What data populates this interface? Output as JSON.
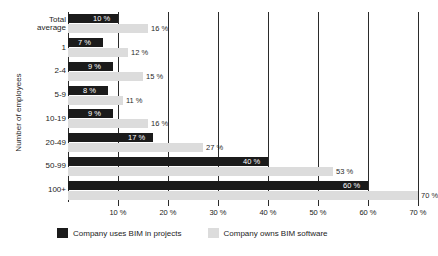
{
  "chart_data": {
    "type": "bar",
    "orientation": "horizontal",
    "title": "",
    "xlabel": "",
    "ylabel": "Number of employees",
    "xlim": [
      0,
      70
    ],
    "xticks": [
      10,
      20,
      30,
      40,
      50,
      60,
      70
    ],
    "xtick_labels": [
      "10 %",
      "20 %",
      "30 %",
      "40 %",
      "50 %",
      "60 %",
      "70 %"
    ],
    "grid": true,
    "legend_position": "bottom",
    "categories": [
      "Total average",
      "1",
      "2-4",
      "5-9",
      "10-19",
      "20-49",
      "50-99",
      "100+"
    ],
    "series": [
      {
        "name": "Company uses BIM in projects",
        "color": "#1b1b1b",
        "values": [
          10,
          7,
          9,
          8,
          9,
          17,
          40,
          60
        ],
        "labels": [
          "10 %",
          "7 %",
          "9 %",
          "8 %",
          "9 %",
          "17 %",
          "40 %",
          "60 %"
        ]
      },
      {
        "name": "Company owns BIM software",
        "color": "#dcdcdc",
        "values": [
          16,
          12,
          15,
          11,
          16,
          27,
          53,
          70
        ],
        "labels": [
          "16 %",
          "12 %",
          "15 %",
          "11 %",
          "16 %",
          "27 %",
          "53 %",
          "70 %"
        ]
      }
    ]
  },
  "axis": {
    "y_title": "Number of employees",
    "categories": [
      {
        "line1": "Total",
        "line2": "average"
      },
      {
        "line1": "1",
        "line2": ""
      },
      {
        "line1": "2-4",
        "line2": ""
      },
      {
        "line1": "5-9",
        "line2": ""
      },
      {
        "line1": "10-19",
        "line2": ""
      },
      {
        "line1": "20-49",
        "line2": ""
      },
      {
        "line1": "50-99",
        "line2": ""
      },
      {
        "line1": "100+",
        "line2": ""
      }
    ],
    "xtick_labels": [
      "10 %",
      "20 %",
      "30 %",
      "40 %",
      "50 %",
      "60 %",
      "70 %"
    ]
  },
  "legend": {
    "items": [
      {
        "label": "Company uses BIM in projects",
        "color": "#1b1b1b"
      },
      {
        "label": "Company owns BIM software",
        "color": "#dcdcdc"
      }
    ]
  }
}
